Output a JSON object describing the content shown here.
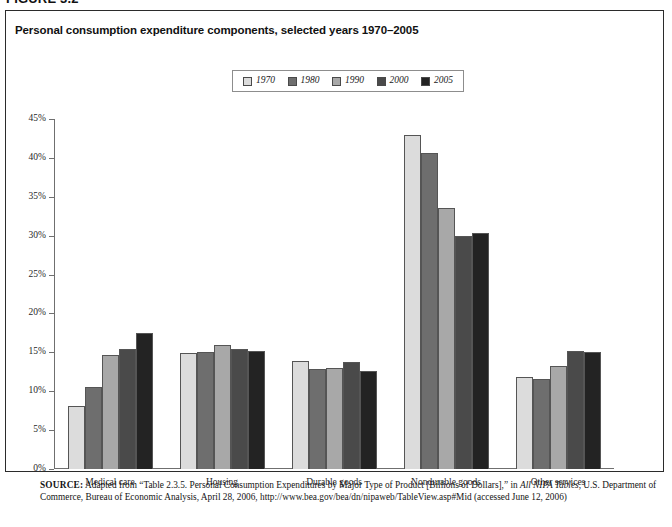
{
  "figure": {
    "label": "FIGURE 3.2",
    "title": "Personal consumption expenditure components, selected years 1970–2005"
  },
  "legend": {
    "position": "top-center",
    "items": [
      {
        "label": "1970",
        "color": "#dcdcdc"
      },
      {
        "label": "1980",
        "color": "#6e6e6e"
      },
      {
        "label": "1990",
        "color": "#a8a8a8"
      },
      {
        "label": "2000",
        "color": "#4a4a4a"
      },
      {
        "label": "2005",
        "color": "#232323"
      }
    ]
  },
  "axis": {
    "y_ticks": [
      "0%",
      "5%",
      "10%",
      "15%",
      "20%",
      "25%",
      "30%",
      "35%",
      "40%",
      "45%"
    ]
  },
  "source": {
    "prefix": "SOURCE:",
    "line1_a": " Adapted from “Table 2.3.5. Personal Consumption Expenditures by Major Type of Product [Billions of Dollars],” in ",
    "line1_italic": "All NIPA Tables",
    "line1_b": ", U.S. Department of Commerce, Bureau of Economic Analysis, April 28, 2006, http://www.bea.gov/bea/dn/nipaweb/TableView.asp#Mid (accessed June 12, 2006)"
  },
  "chart_data": {
    "type": "bar",
    "title": "Personal consumption expenditure components, selected years 1970–2005",
    "xlabel": "",
    "ylabel": "",
    "ylim": [
      0,
      45
    ],
    "ytick_interval": 5,
    "grid": false,
    "legend_position": "top-center",
    "categories": [
      "Medical care",
      "Housing",
      "Durable goods",
      "Nondurable goods",
      "Other services"
    ],
    "series": [
      {
        "name": "1970",
        "color": "#dcdcdc",
        "values": [
          8.1,
          14.9,
          13.9,
          42.9,
          11.8
        ]
      },
      {
        "name": "1980",
        "color": "#6e6e6e",
        "values": [
          10.6,
          15.0,
          12.9,
          40.6,
          11.6
        ]
      },
      {
        "name": "1990",
        "color": "#a8a8a8",
        "values": [
          14.7,
          16.0,
          13.0,
          33.5,
          13.3
        ]
      },
      {
        "name": "2000",
        "color": "#4a4a4a",
        "values": [
          15.4,
          15.4,
          13.7,
          30.0,
          15.2
        ]
      },
      {
        "name": "2005",
        "color": "#232323",
        "values": [
          17.5,
          15.2,
          12.6,
          30.4,
          15.0
        ]
      }
    ]
  }
}
